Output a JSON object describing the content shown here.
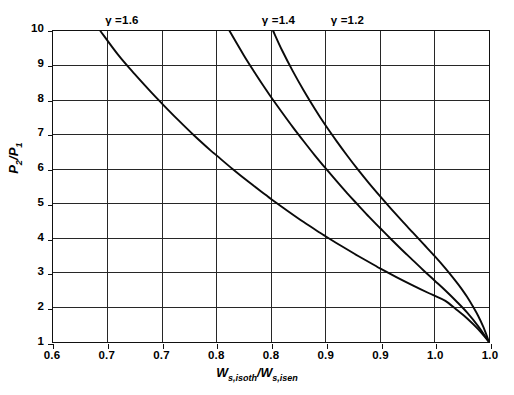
{
  "chart_data": {
    "type": "line",
    "title": "",
    "subtitle": "",
    "xlabel": "Ws,isoth/Ws,isen",
    "ylabel": "P2/P1",
    "xlim": [
      0.6,
      1.0
    ],
    "ylim": [
      1,
      10
    ],
    "grid": true,
    "legend_position": "inline-annotations-top",
    "x_tick_labels": [
      "0.6",
      "0.7",
      "0.7",
      "0.8",
      "0.8",
      "0.9",
      "0.9",
      "1.0",
      "1.0"
    ],
    "x_tick_values": [
      0.6,
      0.65,
      0.7,
      0.75,
      0.8,
      0.85,
      0.9,
      0.95,
      1.0
    ],
    "y_tick_labels": [
      "1",
      "2",
      "3",
      "4",
      "5",
      "6",
      "7",
      "8",
      "9",
      "10"
    ],
    "y_tick_values": [
      1,
      2,
      3,
      4,
      5,
      6,
      7,
      8,
      9,
      10
    ],
    "annotations": [
      {
        "text": "γ =1.6",
        "x": 0.662,
        "y": 10.0
      },
      {
        "text": "γ =1.4",
        "x": 0.805,
        "y": 10.0
      },
      {
        "text": "γ =1.2",
        "x": 0.868,
        "y": 10.0
      }
    ],
    "series": [
      {
        "name": "γ =1.6",
        "label": "γ =1.6",
        "color": "#0a0a0a",
        "points": [
          [
            0.6435,
            10.0
          ],
          [
            0.66,
            9.3
          ],
          [
            0.675,
            8.75
          ],
          [
            0.69,
            8.23
          ],
          [
            0.7,
            7.9
          ],
          [
            0.715,
            7.42
          ],
          [
            0.73,
            6.96
          ],
          [
            0.745,
            6.53
          ],
          [
            0.75,
            6.4
          ],
          [
            0.765,
            6.0
          ],
          [
            0.78,
            5.62
          ],
          [
            0.795,
            5.26
          ],
          [
            0.8,
            5.14
          ],
          [
            0.815,
            4.8
          ],
          [
            0.83,
            4.47
          ],
          [
            0.845,
            4.16
          ],
          [
            0.85,
            4.06
          ],
          [
            0.865,
            3.77
          ],
          [
            0.88,
            3.49
          ],
          [
            0.895,
            3.22
          ],
          [
            0.9,
            3.13
          ],
          [
            0.915,
            2.88
          ],
          [
            0.93,
            2.64
          ],
          [
            0.945,
            2.41
          ],
          [
            0.95,
            2.34
          ],
          [
            0.96,
            2.19
          ],
          [
            0.97,
            1.94
          ],
          [
            0.98,
            1.68
          ],
          [
            0.99,
            1.37
          ],
          [
            1.0,
            1.0
          ]
        ]
      },
      {
        "name": "γ =1.4",
        "label": "γ =1.4",
        "color": "#0a0a0a",
        "points": [
          [
            0.762,
            10.0
          ],
          [
            0.775,
            9.3
          ],
          [
            0.785,
            8.8
          ],
          [
            0.795,
            8.32
          ],
          [
            0.8,
            8.09
          ],
          [
            0.81,
            7.65
          ],
          [
            0.82,
            7.22
          ],
          [
            0.83,
            6.81
          ],
          [
            0.84,
            6.41
          ],
          [
            0.85,
            6.03
          ],
          [
            0.86,
            5.66
          ],
          [
            0.87,
            5.3
          ],
          [
            0.88,
            4.96
          ],
          [
            0.89,
            4.62
          ],
          [
            0.9,
            4.3
          ],
          [
            0.91,
            3.98
          ],
          [
            0.92,
            3.67
          ],
          [
            0.93,
            3.37
          ],
          [
            0.94,
            3.07
          ],
          [
            0.95,
            2.78
          ],
          [
            0.96,
            2.49
          ],
          [
            0.97,
            2.18
          ],
          [
            0.98,
            1.85
          ],
          [
            0.99,
            1.46
          ],
          [
            1.0,
            1.0
          ]
        ]
      },
      {
        "name": "γ =1.2",
        "label": "γ =1.2",
        "color": "#0a0a0a",
        "points": [
          [
            0.802,
            10.0
          ],
          [
            0.81,
            9.45
          ],
          [
            0.82,
            8.84
          ],
          [
            0.83,
            8.28
          ],
          [
            0.84,
            7.76
          ],
          [
            0.85,
            7.27
          ],
          [
            0.86,
            6.82
          ],
          [
            0.87,
            6.39
          ],
          [
            0.88,
            5.98
          ],
          [
            0.89,
            5.59
          ],
          [
            0.9,
            5.22
          ],
          [
            0.91,
            4.86
          ],
          [
            0.92,
            4.51
          ],
          [
            0.93,
            4.17
          ],
          [
            0.94,
            3.83
          ],
          [
            0.95,
            3.49
          ],
          [
            0.96,
            3.13
          ],
          [
            0.97,
            2.74
          ],
          [
            0.975,
            2.53
          ],
          [
            0.98,
            2.3
          ],
          [
            0.985,
            2.04
          ],
          [
            0.99,
            1.76
          ],
          [
            0.995,
            1.42
          ],
          [
            1.0,
            1.0
          ]
        ]
      }
    ]
  },
  "axis": {
    "y_title_main": "P",
    "y_title_sub1": "2",
    "y_title_mid": "/P",
    "y_title_sub2": "1",
    "x_title_w1": "W",
    "x_title_sub1": "s,isoth",
    "x_title_slash": "/",
    "x_title_w2": "W",
    "x_title_sub2": "s,isen"
  },
  "style": {
    "curve_color": "#0a0a0a",
    "grid_color": "#262626",
    "frame_color": "#111111",
    "background": "#ffffff"
  }
}
